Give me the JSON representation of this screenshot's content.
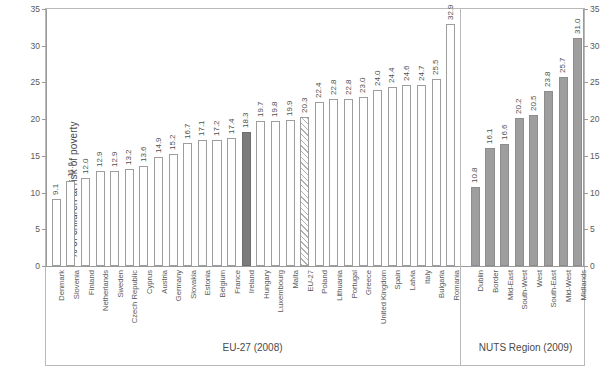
{
  "chart_data": {
    "type": "bar",
    "title": "",
    "xlabel": "",
    "ylabel": "% of children at risk of poverty",
    "ylabel_right": "% of children at risk of poverty",
    "ylim": [
      0,
      35
    ],
    "yticks": [
      0,
      5,
      10,
      15,
      20,
      25,
      30,
      35
    ],
    "grid": false,
    "legend": "none",
    "groups": [
      {
        "name": "EU-27 (2008)",
        "caption": "EU-27 (2008)"
      },
      {
        "name": "NUTS Region (2009)",
        "caption": "NUTS Region (2009)"
      }
    ],
    "categories": [
      "Denmark",
      "Slovenia",
      "Finland",
      "Netherlands",
      "Sweden",
      "Czech Republic",
      "Cyprus",
      "Austria",
      "Germany",
      "Slovakia",
      "Estonia",
      "Belgium",
      "France",
      "Ireland",
      "Hungary",
      "Luxembourg",
      "Malta",
      "EU-27",
      "Poland",
      "Lithuania",
      "Portugal",
      "Greece",
      "United Kingdom",
      "Spain",
      "Latvia",
      "Italy",
      "Bulgaria",
      "Romania",
      "Dublin",
      "Border",
      "Mid-East",
      "South-West",
      "West",
      "South-East",
      "Mid-West",
      "Midlands"
    ],
    "values": [
      9.1,
      11.6,
      12.0,
      12.9,
      12.9,
      13.2,
      13.6,
      14.9,
      15.2,
      16.7,
      17.1,
      17.2,
      17.4,
      18.3,
      19.7,
      19.8,
      19.9,
      20.3,
      22.4,
      22.8,
      22.8,
      23.0,
      24.0,
      24.4,
      24.6,
      24.7,
      25.5,
      32.9,
      10.8,
      16.1,
      16.6,
      20.2,
      20.5,
      23.8,
      25.7,
      31.0
    ],
    "value_labels": [
      "9.1",
      "11.6",
      "12.0",
      "12.9",
      "12.9",
      "13.2",
      "13.6",
      "14.9",
      "15.2",
      "16.7",
      "17.1",
      "17.2",
      "17.4",
      "18.3",
      "19.7",
      "19.8",
      "19.9",
      "20.3",
      "22.4",
      "22.8",
      "22.8",
      "23.0",
      "24.0",
      "24.4",
      "24.6",
      "24.7",
      "25.5",
      "32.9",
      "10.8",
      "16.1",
      "16.6",
      "20.2",
      "20.5",
      "23.8",
      "25.7",
      "31.0"
    ],
    "styles": [
      "open",
      "open",
      "open",
      "open",
      "open",
      "open",
      "open",
      "open",
      "open",
      "open",
      "open",
      "open",
      "open",
      "dark",
      "open",
      "open",
      "open",
      "hatch",
      "open",
      "open",
      "open",
      "open",
      "open",
      "open",
      "open",
      "open",
      "open",
      "open",
      "filled",
      "filled",
      "filled",
      "filled",
      "filled",
      "filled",
      "filled",
      "filled"
    ],
    "group_index": [
      0,
      0,
      0,
      0,
      0,
      0,
      0,
      0,
      0,
      0,
      0,
      0,
      0,
      0,
      0,
      0,
      0,
      0,
      0,
      0,
      0,
      0,
      0,
      0,
      0,
      0,
      0,
      0,
      1,
      1,
      1,
      1,
      1,
      1,
      1,
      1
    ],
    "colors": {
      "open_fill": "#fefefe",
      "open_stroke": "#9d9d9d",
      "highlight_fill": "#7b7b7b",
      "region_fill": "#9e9e9e",
      "hatch_stroke": "#b0b0b0",
      "axis": "#9a9a9a",
      "frame": "#b9b9b9",
      "text": "#4a4a4a"
    }
  }
}
